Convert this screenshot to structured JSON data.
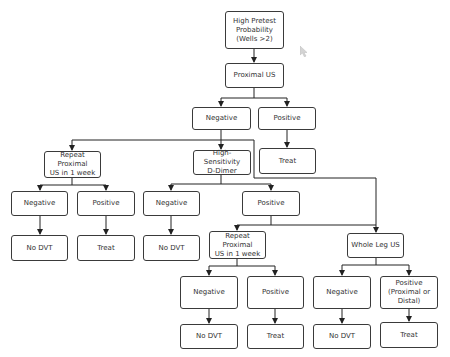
{
  "diagram": {
    "type": "flowchart",
    "colors": {
      "line": "#222222",
      "border": "#3a3a3a",
      "text": "#333333",
      "background": "#ffffff"
    },
    "nodes": {
      "n1": {
        "label": "High Pretest\nProbability\n(Wells >2)"
      },
      "n2": {
        "label": "Proximal US"
      },
      "n3": {
        "label": "Negative"
      },
      "n4": {
        "label": "Positive"
      },
      "n5": {
        "label": "Treat"
      },
      "n6": {
        "label": "Repeat Proximal\nUS in 1 week"
      },
      "n7": {
        "label": "High-Sensitivity\nD-Dimer"
      },
      "n8": {
        "label": "Negative"
      },
      "n9": {
        "label": "Positive"
      },
      "n10": {
        "label": "No DVT"
      },
      "n11": {
        "label": "Treat"
      },
      "n12": {
        "label": "Negative"
      },
      "n13": {
        "label": "No DVT"
      },
      "n14": {
        "label": "Positive"
      },
      "n15": {
        "label": "Repeat Proximal\nUS in 1 week"
      },
      "n16": {
        "label": "Whole Leg US"
      },
      "n17": {
        "label": "Negative"
      },
      "n18": {
        "label": "Positive"
      },
      "n19": {
        "label": "No DVT"
      },
      "n20": {
        "label": "Treat"
      },
      "n21": {
        "label": "Negative"
      },
      "n22": {
        "label": "Positive\n(Proximal or\nDistal)"
      },
      "n23": {
        "label": "No DVT"
      },
      "n24": {
        "label": "Treat"
      }
    },
    "edges": [
      [
        "High Pretest Probability (Wells >2)",
        "Proximal US"
      ],
      [
        "Proximal US",
        "Negative"
      ],
      [
        "Proximal US",
        "Positive"
      ],
      [
        "Positive",
        "Treat"
      ],
      [
        "Negative",
        "Repeat Proximal US in 1 week"
      ],
      [
        "Negative",
        "High-Sensitivity D-Dimer"
      ],
      [
        "Negative",
        "Whole Leg US"
      ],
      [
        "Repeat Proximal US in 1 week",
        "Negative"
      ],
      [
        "Repeat Proximal US in 1 week",
        "Positive"
      ],
      [
        "Negative",
        "No DVT"
      ],
      [
        "Positive",
        "Treat"
      ],
      [
        "High-Sensitivity D-Dimer",
        "Negative"
      ],
      [
        "High-Sensitivity D-Dimer",
        "Positive"
      ],
      [
        "Negative",
        "No DVT"
      ],
      [
        "Positive",
        "Repeat Proximal US in 1 week"
      ],
      [
        "Positive",
        "Whole Leg US"
      ],
      [
        "Repeat Proximal US in 1 week",
        "Negative"
      ],
      [
        "Repeat Proximal US in 1 week",
        "Positive"
      ],
      [
        "Negative",
        "No DVT"
      ],
      [
        "Positive",
        "Treat"
      ],
      [
        "Whole Leg US",
        "Negative"
      ],
      [
        "Whole Leg US",
        "Positive (Proximal or Distal)"
      ],
      [
        "Negative",
        "No DVT"
      ],
      [
        "Positive (Proximal or Distal)",
        "Treat"
      ]
    ]
  }
}
